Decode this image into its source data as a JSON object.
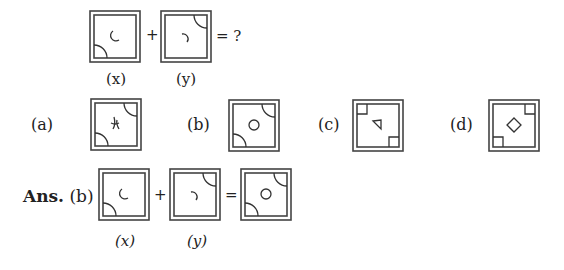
{
  "question": {
    "operators": {
      "plus": "+",
      "equals_question": "= ?"
    },
    "figures": [
      {
        "id": "x",
        "label": "(x)",
        "corner_shapes": [
          "quarter-arc-bottom-left"
        ],
        "center_shape": "arc-open-right"
      },
      {
        "id": "y",
        "label": "(y)",
        "corner_shapes": [
          "quarter-arc-top-right"
        ],
        "center_shape": "arc-open-left"
      }
    ]
  },
  "options": [
    {
      "label": "(a)",
      "corner_shapes": [
        "quarter-arc-top-right",
        "quarter-arc-bottom-left"
      ],
      "center_shape": "cross-curves"
    },
    {
      "label": "(b)",
      "corner_shapes": [
        "quarter-arc-top-right",
        "quarter-arc-bottom-left"
      ],
      "center_shape": "circle"
    },
    {
      "label": "(c)",
      "corner_shapes": [
        "square-top-left",
        "square-bottom-right"
      ],
      "center_shape": "triangle"
    },
    {
      "label": "(d)",
      "corner_shapes": [
        "square-top-right",
        "square-bottom-left"
      ],
      "center_shape": "diamond"
    }
  ],
  "answer": {
    "prefix": "Ans.",
    "choice": "(b)",
    "operators": {
      "plus": "+",
      "equals": "="
    },
    "labels": {
      "x": "(x)",
      "y": "(y)"
    }
  },
  "colors": {
    "stroke": "#333333",
    "frame": "#444444"
  }
}
